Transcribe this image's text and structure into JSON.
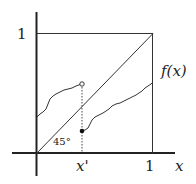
{
  "diagram": {
    "type": "fixed-point-function-plot",
    "labels": {
      "y_one": "1",
      "x_one": "1",
      "x_axis": "x",
      "x_prime": "x'",
      "function": "f(x)",
      "angle": "45°"
    },
    "colors": {
      "ink": "#222222",
      "background": "#ffffff"
    },
    "elements": {
      "unit_square": true,
      "diagonal": "y = x (45° line)",
      "left_curve": "curve from (0, ~0.33) to open circle at x'",
      "right_curve": "curve from filled dot at x' rising to (1, ~0.59)",
      "dashed_line": "vertical dotted line at x' from x-axis to open circle"
    }
  }
}
